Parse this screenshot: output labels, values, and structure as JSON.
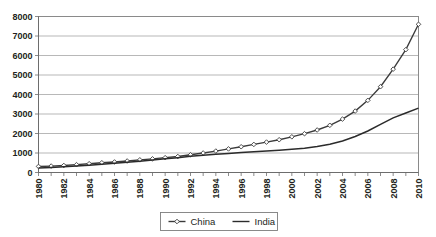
{
  "chart_data": {
    "type": "line",
    "title": "",
    "xlabel": "",
    "ylabel": "",
    "ylim": [
      0,
      8000
    ],
    "xlim": [
      1980,
      2010
    ],
    "grid": true,
    "legend_position": "bottom",
    "ytick_labels": [
      "8000",
      "7000",
      "6000",
      "5000",
      "4000",
      "3000",
      "2000",
      "1000",
      "0"
    ],
    "ytick_values": [
      8000,
      7000,
      6000,
      5000,
      4000,
      3000,
      2000,
      1000,
      0
    ],
    "xtick_labels": [
      "1980",
      "1982",
      "1984",
      "1986",
      "1988",
      "1990",
      "1992",
      "1994",
      "1996",
      "1998",
      "2000",
      "2002",
      "2004",
      "2006",
      "2008",
      "2010"
    ],
    "x": [
      1980,
      1981,
      1982,
      1983,
      1984,
      1985,
      1986,
      1987,
      1988,
      1989,
      1990,
      1991,
      1992,
      1993,
      1994,
      1995,
      1996,
      1997,
      1998,
      1999,
      2000,
      2001,
      2002,
      2003,
      2004,
      2005,
      2006,
      2007,
      2008,
      2009,
      2010
    ],
    "series": [
      {
        "name": "China",
        "marker": "diamond",
        "color": "#3b3b3b",
        "values": [
          310,
          330,
          360,
          400,
          450,
          500,
          540,
          590,
          650,
          700,
          760,
          820,
          910,
          1000,
          1100,
          1210,
          1320,
          1440,
          1560,
          1680,
          1830,
          1990,
          2180,
          2420,
          2740,
          3150,
          3700,
          4400,
          5300,
          6300,
          7600
        ]
      },
      {
        "name": "India",
        "marker": "none",
        "color": "#2b2b2b",
        "values": [
          230,
          260,
          290,
          330,
          370,
          420,
          470,
          520,
          580,
          640,
          700,
          760,
          830,
          880,
          930,
          980,
          1020,
          1060,
          1100,
          1140,
          1190,
          1250,
          1330,
          1450,
          1620,
          1850,
          2130,
          2470,
          2800,
          3050,
          3300
        ]
      }
    ],
    "legend": [
      {
        "label": "China",
        "marker": "diamond"
      },
      {
        "label": "India",
        "marker": "none"
      }
    ]
  }
}
